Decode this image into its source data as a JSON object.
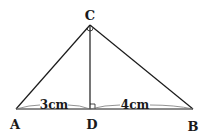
{
  "diagram": {
    "type": "geometry",
    "points": {
      "A": {
        "label": "A",
        "x": 16,
        "y": 109
      },
      "B": {
        "label": "B",
        "x": 193,
        "y": 109
      },
      "C": {
        "label": "C",
        "x": 90,
        "y": 25
      },
      "D": {
        "label": "D",
        "x": 90,
        "y": 109
      }
    },
    "segments": [
      "AC",
      "BC",
      "AB",
      "CD"
    ],
    "lengths": {
      "AD": "3cm",
      "DB": "4cm"
    },
    "right_angle_at": "D",
    "angle_mark_at": "C",
    "colors": {
      "line": "#1a1a1a",
      "brace": "#777777"
    }
  }
}
